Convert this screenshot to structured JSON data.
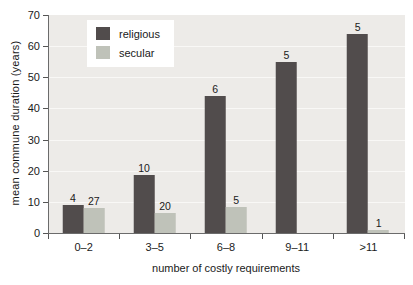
{
  "figure": {
    "background": "#ffffff",
    "plot_bg": "#edebe8",
    "gridline_color": "#f9f8f6",
    "axis_color": "#555555",
    "text_color": "#1a1a1a"
  },
  "chart_data": {
    "type": "bar",
    "title": "",
    "xlabel": "number of costly requirements",
    "ylabel": "mean commune duration (years)",
    "categories": [
      "0–2",
      "3–5",
      "6–8",
      "9–11",
      ">11"
    ],
    "series": [
      {
        "name": "religious",
        "color": "#514c4c",
        "values": [
          9,
          18.5,
          44,
          55,
          64
        ],
        "bar_labels": [
          "4",
          "10",
          "6",
          "5",
          "5"
        ]
      },
      {
        "name": "secular",
        "color": "#bfc2b9",
        "values": [
          8,
          6.5,
          8.5,
          null,
          1
        ],
        "bar_labels": [
          "27",
          "20",
          "5",
          "",
          "1"
        ]
      }
    ],
    "ylim": [
      0,
      70
    ],
    "yticks": [
      0,
      10,
      20,
      30,
      40,
      50,
      60,
      70
    ],
    "grid": true,
    "legend_position": "upper-left"
  }
}
